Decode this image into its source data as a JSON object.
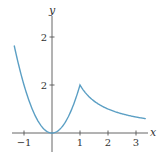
{
  "chart_data": {
    "type": "line",
    "title": "",
    "xlabel": "x",
    "ylabel": "y",
    "xlim": [
      -1.4,
      3.6
    ],
    "ylim": [
      -0.55,
      2.6
    ],
    "grid": false,
    "legend": null,
    "x_ticks": [
      {
        "value": -1,
        "label": "−1"
      },
      {
        "value": 1,
        "label": "1"
      },
      {
        "value": 2,
        "label": "2"
      },
      {
        "value": 3,
        "label": "3"
      }
    ],
    "y_ticks": [
      {
        "value": 1,
        "label": "2"
      },
      {
        "value": 2,
        "label": "2"
      }
    ],
    "series": [
      {
        "name": "f(x) = x^2 for x ≤ 1; 1/x for x > 1",
        "color": "#5b9fc4",
        "x": [
          -1.35,
          -1.2,
          -1.0,
          -0.8,
          -0.6,
          -0.4,
          -0.2,
          0.0,
          0.2,
          0.4,
          0.6,
          0.8,
          1.0,
          1.25,
          1.5,
          1.75,
          2.0,
          2.25,
          2.5,
          2.75,
          3.0,
          3.35
        ],
        "y": [
          1.8225,
          1.44,
          1.0,
          0.64,
          0.36,
          0.16,
          0.04,
          0.0,
          0.04,
          0.16,
          0.36,
          0.64,
          1.0,
          0.8,
          0.667,
          0.571,
          0.5,
          0.444,
          0.4,
          0.364,
          0.333,
          0.299
        ]
      }
    ]
  },
  "axes": {
    "x_label": "x",
    "y_label": "y",
    "x_tick_labels": [
      "−1",
      "1",
      "2",
      "3"
    ],
    "y_tick_labels": [
      "2",
      "2"
    ]
  },
  "colors": {
    "curve": "#5b9fc4",
    "axis": "#555555"
  }
}
